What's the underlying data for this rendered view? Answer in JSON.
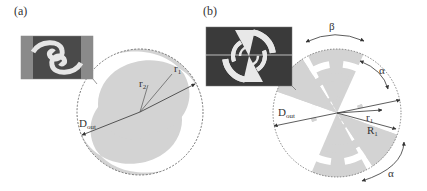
{
  "panels": [
    {
      "id": "a",
      "label": "(a)",
      "title": "Spiral antenna",
      "annotations": {
        "r1": "r",
        "r1_sub": "1",
        "r2": "r",
        "r2_sub": "2",
        "dout": "D",
        "dout_sub": "out"
      }
    },
    {
      "id": "b",
      "label": "(b)",
      "title": "Log-periodic antenna",
      "annotations": {
        "beta": "β",
        "alpha_top": "α",
        "alpha_bottom": "α",
        "dout": "D",
        "dout_sub": "out",
        "r1": "r",
        "r1_sub": "1",
        "R1": "R",
        "R1_sub": "1"
      }
    }
  ],
  "colors": {
    "metal_fill": "#d3d3d3",
    "outline": "#555555",
    "arrow": "#333333",
    "photo_bg": "#3a3a3a",
    "photo_metal": "#e8e8e8"
  }
}
